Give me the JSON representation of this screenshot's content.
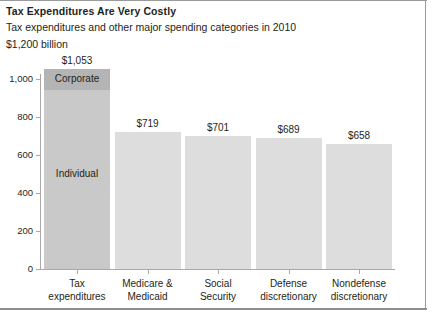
{
  "figure": {
    "title": "Tax Expenditures Are Very Costly",
    "subtitle": "Tax expenditures and other major spending categories in 2010",
    "unit_label": "$1,200 billion"
  },
  "colors": {
    "bar_primary": "#c9c9c9",
    "bar_primary_top": "#b4b4b4",
    "bar_other": "#dddddd",
    "axis": "#a8a8a8",
    "text": "#231f20",
    "frame": "#9a9a9a"
  },
  "chart_data": {
    "type": "bar",
    "title": "Tax Expenditures Are Very Costly",
    "subtitle": "Tax expenditures and other major spending categories in 2010",
    "xlabel": "",
    "ylabel": "$1,200 billion",
    "ylim": [
      0,
      1100
    ],
    "grid": false,
    "legend": "none",
    "ytick_labels": [
      "0",
      "200",
      "400",
      "600",
      "800",
      "1,000"
    ],
    "ytick_values": [
      0,
      200,
      400,
      600,
      800,
      1000
    ],
    "categories": [
      "Tax expenditures",
      "Medicare & Medicaid",
      "Social Security",
      "Defense discretionary",
      "Nondefense discretionary"
    ],
    "category_lines": [
      [
        "Tax",
        "expenditures"
      ],
      [
        "Medicare &",
        "Medicaid"
      ],
      [
        "Social",
        "Security"
      ],
      [
        "Defense",
        "discretionary"
      ],
      [
        "Nondefense",
        "discretionary"
      ]
    ],
    "values": [
      1053,
      719,
      701,
      689,
      658
    ],
    "value_labels": [
      "$1,053",
      "$719",
      "$701",
      "$689",
      "$658"
    ],
    "stacked_first_bar": {
      "category": "Tax expenditures",
      "total": 1053,
      "segments": [
        {
          "name": "Corporate",
          "value": 110
        },
        {
          "name": "Individual",
          "value": 943
        }
      ]
    }
  }
}
